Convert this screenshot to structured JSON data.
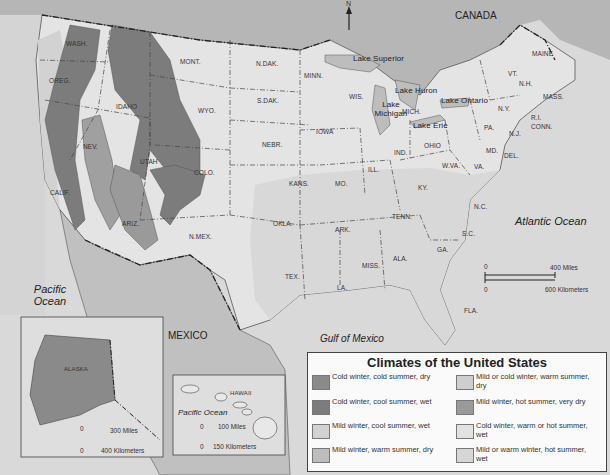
{
  "title": "Climates of the United States",
  "countries": {
    "canada": "CANADA",
    "mexico": "MEXICO"
  },
  "oceans": {
    "atlantic": "Atlantic Ocean",
    "pacific_main": "Pacific Ocean",
    "gulf": "Gulf of Mexico",
    "pacific_hawaii": "Pacific Ocean"
  },
  "north_arrow": "N",
  "lakes": [
    "Lake Superior",
    "Lake Huron",
    "Lake Michigan",
    "Lake Ontario",
    "Lake Erie"
  ],
  "states": {
    "wash": "WASH.",
    "oreg": "OREG.",
    "calif": "CALIF.",
    "nev": "NEV.",
    "idaho": "IDAHO",
    "mont": "MONT.",
    "wyo": "WYO.",
    "utah": "UTAH",
    "colo": "COLO.",
    "ariz": "ARIZ.",
    "nmex": "N.MEX.",
    "ndak": "N.DAK.",
    "sdak": "S.DAK.",
    "nebr": "NEBR.",
    "kans": "KANS.",
    "okla": "OKLA.",
    "tex": "TEX.",
    "minn": "MINN.",
    "iowa": "IOWA",
    "mo": "MO.",
    "ark": "ARK.",
    "la": "LA.",
    "wis": "WIS.",
    "ill": "ILL.",
    "mich": "MICH.",
    "ind": "IND.",
    "ohio": "OHIO",
    "ky": "KY.",
    "tenn": "TENN.",
    "miss": "MISS.",
    "ala": "ALA.",
    "ga": "GA.",
    "fla": "FLA.",
    "sc": "S.C.",
    "nc": "N.C.",
    "va": "VA.",
    "wva": "W.VA.",
    "md": "MD.",
    "del": "DEL.",
    "pa": "PA.",
    "nj": "N.J.",
    "ny": "N.Y.",
    "conn": "CONN.",
    "ri": "R.I.",
    "mass": "MASS.",
    "vt": "VT.",
    "nh": "N.H.",
    "maine": "MAINE",
    "alaska": "ALASKA",
    "hawaii": "HAWAII"
  },
  "scales": {
    "main": {
      "zero": "0",
      "miles": "400 Miles",
      "zero_km": "0",
      "km": "600 Kilometers"
    },
    "alaska": {
      "zero": "0",
      "miles": "300 Miles",
      "zero_km": "0",
      "km": "400 Kilometers"
    },
    "hawaii": {
      "zero": "0",
      "miles": "100 Miles",
      "zero_km": "0",
      "km": "150 Kilometers"
    }
  },
  "legend": {
    "title": "Climates of the United States",
    "items": [
      {
        "label": "Cold winter, cold summer, dry",
        "color": "#8a8a8a"
      },
      {
        "label": "Cold winter, cool summer, wet",
        "color": "#7c7c7c"
      },
      {
        "label": "Mild winter, cool summer, wet",
        "color": "#d2d2d2"
      },
      {
        "label": "Mild winter, warm summer, dry",
        "color": "#bdbdbd"
      },
      {
        "label": "Mild or cold winter, warm summer, dry",
        "color": "#cecece"
      },
      {
        "label": "Mild winter, hot summer, very dry",
        "color": "#9a9a9a"
      },
      {
        "label": "Cold winter, warm or hot summer, wet",
        "color": "#e2e2e2"
      },
      {
        "label": "Mild or warm winter, hot summer, wet",
        "color": "#d6d6d6"
      }
    ]
  }
}
